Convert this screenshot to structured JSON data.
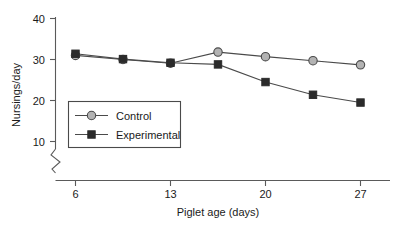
{
  "chart_data": {
    "type": "line",
    "title": "",
    "xlabel": "Piglet age (days)",
    "ylabel": "Nursings/day",
    "x": [
      6,
      9.5,
      13,
      16.5,
      20,
      23.5,
      27
    ],
    "xlim": [
      4.2,
      29.0
    ],
    "ylim": [
      8.0,
      40.0
    ],
    "xticks": [
      6,
      13,
      20,
      27
    ],
    "xtick_labels": [
      "6",
      "13",
      "20",
      "27"
    ],
    "yticks": [
      10,
      20,
      30,
      40
    ],
    "ytick_labels": [
      "10",
      "20",
      "30",
      "40"
    ],
    "grid": false,
    "y_axis_break": true,
    "legend_position": "lower-left-inside",
    "series": [
      {
        "name": "Control",
        "marker": "circle",
        "marker_fill": "#b3b3b3",
        "line_color": "#4a4a4a",
        "values": [
          31.0,
          30.0,
          29.1,
          31.8,
          30.7,
          29.7,
          28.7
        ]
      },
      {
        "name": "Experimental",
        "marker": "square",
        "marker_fill": "#2b2b2b",
        "line_color": "#4a4a4a",
        "values": [
          31.4,
          30.1,
          29.2,
          28.8,
          24.5,
          21.4,
          19.5
        ]
      }
    ]
  },
  "axes": {
    "y_title": "Nursings/day",
    "x_title": "Piglet age (days)",
    "y_tick_40": "40",
    "y_tick_30": "30",
    "y_tick_20": "20",
    "y_tick_10": "10",
    "x_tick_6": "6",
    "x_tick_13": "13",
    "x_tick_20": "20",
    "x_tick_27": "27"
  },
  "legend": {
    "entry_control": "Control",
    "entry_experimental": "Experimental"
  },
  "colors": {
    "axis": "#5a5a5a",
    "line": "#4a4a4a",
    "control_marker": "#b3b3b3",
    "experimental_marker": "#2b2b2b",
    "background": "#ffffff",
    "text": "#1a1a1a"
  }
}
